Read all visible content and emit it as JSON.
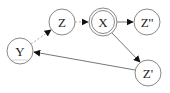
{
  "diagram": {
    "type": "directed-graph",
    "nodes": [
      {
        "id": "Y",
        "label": "Y",
        "x": 20,
        "y": 51,
        "r": 13,
        "double": false
      },
      {
        "id": "Z",
        "label": "Z",
        "x": 62,
        "y": 22,
        "r": 13,
        "double": false
      },
      {
        "id": "X",
        "label": "X",
        "x": 103,
        "y": 22,
        "r": 14,
        "double": true
      },
      {
        "id": "Z2",
        "label": "Z''",
        "x": 147,
        "y": 22,
        "r": 13,
        "double": false
      },
      {
        "id": "Z1",
        "label": "Z'",
        "x": 148,
        "y": 73,
        "r": 13,
        "double": false
      }
    ],
    "edges": [
      {
        "from": "Y",
        "to": "Z",
        "style": "dashed"
      },
      {
        "from": "Z",
        "to": "X",
        "style": "dashed"
      },
      {
        "from": "X",
        "to": "Z2",
        "style": "solid"
      },
      {
        "from": "X",
        "to": "Z1",
        "style": "solid"
      },
      {
        "from": "Z1",
        "to": "Y",
        "style": "solid"
      }
    ],
    "colors": {
      "stroke": "#888888",
      "edge": "#777777",
      "dashed_edge": "#aaaaaa",
      "arrowhead": "#111111",
      "text": "#222222"
    }
  },
  "labels": {
    "Y": "Y",
    "Z": "Z",
    "X": "X",
    "Z2": "Z''",
    "Z1": "Z'"
  }
}
